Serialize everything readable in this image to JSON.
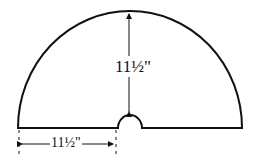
{
  "diagram": {
    "type": "semicircle pattern with center notch",
    "radius_label": "11½\"",
    "base_label": "11½\"",
    "stroke_color": "#111111",
    "background": "#ffffff"
  }
}
